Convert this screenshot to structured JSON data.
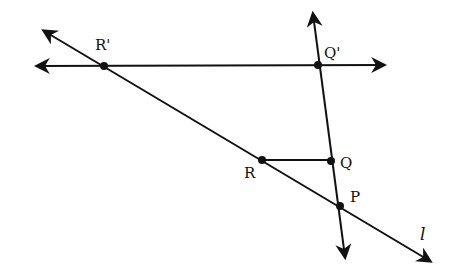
{
  "diagram": {
    "points": [
      {
        "id": "R_prime",
        "label": "R'",
        "x": 104,
        "y": 66,
        "lx": 95,
        "ly": 50
      },
      {
        "id": "Q_prime",
        "label": "Q'",
        "x": 318,
        "y": 65,
        "lx": 324,
        "ly": 58
      },
      {
        "id": "R",
        "label": "R",
        "x": 262,
        "y": 160,
        "lx": 244,
        "ly": 178
      },
      {
        "id": "Q",
        "label": "Q",
        "x": 331,
        "y": 161,
        "lx": 340,
        "ly": 168
      },
      {
        "id": "P",
        "label": "P",
        "x": 340,
        "y": 206,
        "lx": 350,
        "ly": 202
      }
    ],
    "line_label": "l",
    "color": "#111111"
  }
}
